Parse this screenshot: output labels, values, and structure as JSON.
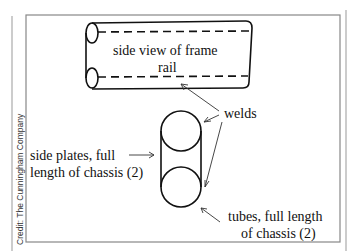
{
  "diagram": {
    "credit": "Credit: The Cunningham Company",
    "labels": {
      "frame_rail_line1": "side view of frame",
      "frame_rail_line2": "rail",
      "welds": "welds",
      "side_plates_line1": "side plates, full",
      "side_plates_line2": "length of chassis (2)",
      "tubes_line1": "tubes, full length",
      "tubes_line2": "of chassis (2)"
    },
    "colors": {
      "stroke": "#111111",
      "frame": "#888888",
      "background": "#ffffff"
    }
  }
}
